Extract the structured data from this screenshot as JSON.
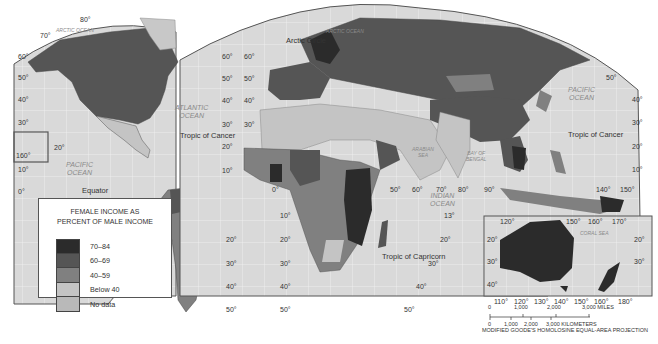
{
  "map": {
    "title": "Female Income as Percent of Male Income",
    "projection": "MODIFIED GOODE'S HOMOLOSINE EQUAL-AREA PROJECTION",
    "colors": {
      "ocean": "#d9d9d9",
      "grid": "#f2f2f2",
      "border": "#555555",
      "class_70_84": "#2b2b2b",
      "class_60_69": "#555555",
      "class_40_59": "#808080",
      "class_below_40": "#c4c4c4",
      "class_no_data": "#b9b9b9"
    },
    "oceans": {
      "arctic": "ARCTIC OCEAN",
      "atlantic_1": "ATLANTIC",
      "atlantic_2": "OCEAN",
      "pacific_w_1": "PACIFIC",
      "pacific_w_2": "OCEAN",
      "pacific_e_1": "PACIFIC",
      "pacific_e_2": "OCEAN",
      "indian_1": "INDIAN",
      "indian_2": "OCEAN",
      "arabian_1": "ARABIAN",
      "arabian_2": "SEA",
      "bengal_1": "BAY OF",
      "bengal_2": "BENGAL",
      "coral": "CORAL SEA",
      "arctic_e": "ARCTIC OCEAN"
    },
    "features": {
      "arctic_circle": "Arctic Circle",
      "tropic_cancer_w": "Tropic of Cancer",
      "tropic_cancer_e": "Tropic of Cancer",
      "equator": "Equator",
      "tropic_capricorn": "Tropic of Capricorn"
    },
    "lat_labels": {
      "l80": "80°",
      "l70": "70°",
      "l60": "60°",
      "l50": "50°",
      "l40": "40°",
      "l30": "30°",
      "l20": "20°",
      "l10": "10°",
      "l0": "0°",
      "r60": "60°",
      "r50": "50°",
      "r40": "40°",
      "r30": "30°",
      "r20": "20°",
      "r10": "10°",
      "c60": "60°",
      "c50": "50°",
      "c40": "40°",
      "c30": "30°",
      "c20": "20°",
      "c10": "10°",
      "sa10": "10°",
      "sa20": "20°",
      "sa30": "30°",
      "sa40": "40°",
      "sa50": "50°",
      "af10": "10°",
      "af20a": "20°",
      "af20b": "20°",
      "af30a": "30°",
      "af30b": "30°",
      "af40a": "40°",
      "af40b": "40°",
      "af50a": "50°",
      "af50b": "50°",
      "io13": "13°",
      "io20": "20°",
      "io30": "30°",
      "io40": "40°",
      "io50": "50°",
      "pe50": "50°",
      "pe40": "40°",
      "pe30": "30°",
      "pe20": "20°",
      "pe10": "10°",
      "hawaii160": "160°",
      "hawaii20": "20°"
    },
    "lon_labels": {
      "zero": "0°",
      "l50": "50°",
      "l60": "60°",
      "l70": "70°",
      "l80": "80°",
      "l90": "90°",
      "l140": "140°",
      "l150": "150°"
    },
    "australia_inset": {
      "top": [
        "120°",
        "150°",
        "160°",
        "170°"
      ],
      "bottom": [
        "110°",
        "120°",
        "130°",
        "140°",
        "150°",
        "160°",
        "180°"
      ],
      "left": [
        "20°",
        "30°",
        "40°"
      ],
      "right": [
        "20°",
        "30°"
      ]
    }
  },
  "legend": {
    "title_line1": "FEMALE INCOME AS",
    "title_line2": "PERCENT OF MALE INCOME",
    "items": [
      {
        "label": "70–84",
        "color": "#2b2b2b"
      },
      {
        "label": "60–69",
        "color": "#555555"
      },
      {
        "label": "40–59",
        "color": "#808080"
      },
      {
        "label": "Below 40",
        "color": "#c4c4c4"
      },
      {
        "label": "No data",
        "color": "#b9b9b9"
      }
    ]
  },
  "scale": {
    "miles": [
      "0",
      "1,000",
      "2,000",
      "3,000 MILES"
    ],
    "km": [
      "0",
      "1,000",
      "2,000",
      "3,000 KILOMETERS"
    ]
  }
}
